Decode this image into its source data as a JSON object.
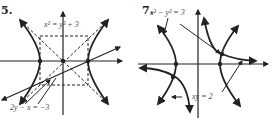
{
  "figures": [
    {
      "number": "5.",
      "labels": {
        "top_equation": "x² = y² + 3",
        "bottom_equation": "2y − x = −3"
      },
      "elements": [
        "x-axis",
        "y-axis",
        "hyperbola (left/right branches)",
        "dashed asymptote box",
        "dashed asymptotes",
        "line 2y − x = −3",
        "intersection points"
      ]
    },
    {
      "number": "7.",
      "labels": {
        "top_equation": "x² − y² = 3",
        "bottom_equation": "xy = 2"
      },
      "elements": [
        "x-axis",
        "y-axis",
        "hyperbola x² − y² = 3",
        "hyperbola xy = 2",
        "intersection points"
      ]
    }
  ],
  "colors": {
    "ink": "#222222",
    "background": "#ffffff"
  }
}
